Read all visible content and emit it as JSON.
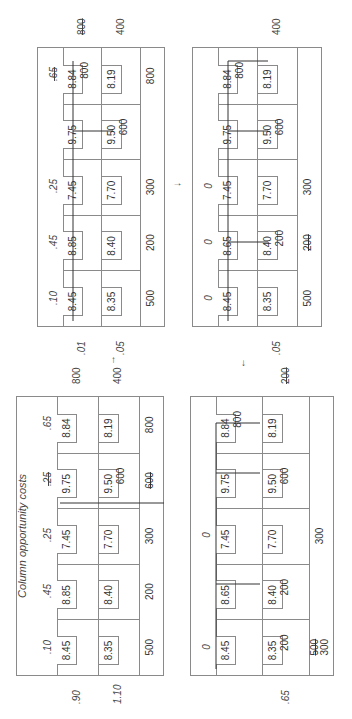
{
  "tables": [
    {
      "id": "A",
      "title": "",
      "column_costs": [
        ".10",
        ".45",
        ".25",
        "",
        ".65"
      ],
      "column_costs_struck": [
        false,
        false,
        false,
        false,
        true
      ],
      "rows": [
        {
          "costs": [
            "8.45",
            "8.85",
            "7.45",
            "9.75",
            "8.84"
          ],
          "allocations": [
            "",
            "",
            "",
            "",
            "800"
          ],
          "row_cost": ".01",
          "supply": "800",
          "supply_struck": true
        },
        {
          "costs": [
            "8.35",
            "8.40",
            "7.70",
            "9.50",
            "8.19"
          ],
          "allocations": [
            "",
            "",
            "",
            "600",
            ""
          ],
          "row_cost": ".05",
          "supply": "400",
          "supply_struck": false
        }
      ],
      "demands": [
        [
          "500"
        ],
        [
          "200"
        ],
        [
          "300"
        ],
        [
          ""
        ],
        [
          "800"
        ]
      ],
      "demands_struck": [
        [
          false
        ],
        [
          false
        ],
        [
          false
        ],
        [
          false
        ],
        [
          false
        ]
      ]
    },
    {
      "id": "B",
      "title": "",
      "column_costs": [
        "0",
        "0",
        "0",
        "",
        ""
      ],
      "column_costs_struck": [
        false,
        false,
        false,
        false,
        false
      ],
      "rows": [
        {
          "costs": [
            "8.45",
            "8.65",
            "7.45",
            "9.75",
            "8.84"
          ],
          "allocations": [
            "",
            "",
            "",
            "",
            "800"
          ],
          "row_cost": "",
          "supply": "",
          "supply_struck": false
        },
        {
          "costs": [
            "8.35",
            "8.40",
            "7.70",
            "9.50",
            "8.19"
          ],
          "allocations": [
            "",
            "200",
            "",
            "600",
            ""
          ],
          "row_cost": ".05",
          "supply": "400",
          "supply_struck": false
        }
      ],
      "demands": [
        [
          "500"
        ],
        [
          "200"
        ],
        [
          "300"
        ],
        [
          ""
        ],
        [
          ""
        ]
      ],
      "demands_struck": [
        [
          false
        ],
        [
          true
        ],
        [
          false
        ],
        [
          false
        ],
        [
          false
        ]
      ]
    },
    {
      "id": "C",
      "title": "Column opportunity costs",
      "column_costs": [
        ".10",
        ".45",
        ".25",
        ".25",
        ".65"
      ],
      "column_costs_struck": [
        false,
        false,
        false,
        true,
        false
      ],
      "rows": [
        {
          "costs": [
            "8.45",
            "8.85",
            "7.45",
            "9.75",
            "8.84"
          ],
          "allocations": [
            "",
            "",
            "",
            "",
            ""
          ],
          "row_cost": ".90",
          "supply": "800",
          "supply_struck": false
        },
        {
          "costs": [
            "8.35",
            "8.40",
            "7.70",
            "9.50",
            "8.19"
          ],
          "allocations": [
            "",
            "",
            "",
            "600",
            ""
          ],
          "row_cost": "1.10",
          "supply": "400",
          "supply_struck": false
        }
      ],
      "demands": [
        [
          "500"
        ],
        [
          "200"
        ],
        [
          "300"
        ],
        [
          "600"
        ],
        [
          "800"
        ]
      ],
      "demands_struck": [
        [
          false
        ],
        [
          false
        ],
        [
          false
        ],
        [
          true
        ],
        [
          false
        ]
      ]
    },
    {
      "id": "D",
      "title": "",
      "column_costs": [
        "0",
        "",
        "0",
        "",
        ""
      ],
      "column_costs_struck": [
        false,
        false,
        false,
        false,
        false
      ],
      "rows": [
        {
          "costs": [
            "8.45",
            "8.65",
            "7.45",
            "9.75",
            "8.84"
          ],
          "allocations": [
            "",
            "",
            "",
            "",
            "800"
          ],
          "row_cost": "",
          "supply": "",
          "supply_struck": false
        },
        {
          "costs": [
            "8.35",
            "8.40",
            "7.70",
            "9.50",
            "8.19"
          ],
          "allocations": [
            "200",
            "200",
            "",
            "600",
            ""
          ],
          "row_cost": ".65",
          "supply": "200",
          "supply_struck": true
        }
      ],
      "demands": [
        [
          "500",
          "300"
        ],
        [
          ""
        ],
        [
          "300"
        ],
        [
          ""
        ],
        [
          ""
        ]
      ],
      "demands_struck": [
        [
          true,
          false
        ],
        [
          false
        ],
        [
          false
        ],
        [
          false
        ],
        [
          false
        ]
      ]
    }
  ],
  "arrows": {
    "a_to_b": "→",
    "c_to_a": "↑",
    "b_to_d": "↓"
  }
}
